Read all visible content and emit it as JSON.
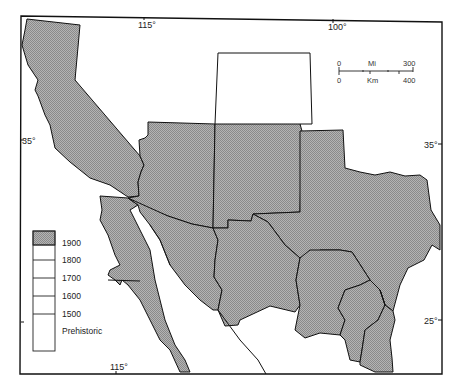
{
  "map": {
    "title": "",
    "fill_color": "#a8a8a8",
    "outline_color": "#111111",
    "graticule": {
      "top": [
        "115°",
        "100°"
      ],
      "bottom": [
        "115°"
      ],
      "left": [
        "35°"
      ],
      "right": [
        "35°",
        "25°"
      ]
    },
    "scale_bar": {
      "miles_start": "0",
      "miles_label": "Mi",
      "miles_end": "300",
      "km_start": "0",
      "km_label": "Km",
      "km_end": "400"
    },
    "legend": {
      "items": [
        {
          "label": "1900",
          "shaded": true
        },
        {
          "label": "1800",
          "shaded": false
        },
        {
          "label": "1700",
          "shaded": false
        },
        {
          "label": "1600",
          "shaded": false
        },
        {
          "label": "1500",
          "shaded": false
        },
        {
          "label": "Prehistoric",
          "shaded": false
        }
      ]
    },
    "regions": [
      {
        "name": "California",
        "shaded": true
      },
      {
        "name": "Arizona",
        "shaded": true
      },
      {
        "name": "New Mexico",
        "shaded": true
      },
      {
        "name": "Colorado",
        "shaded": false
      },
      {
        "name": "Texas",
        "shaded": true
      },
      {
        "name": "Baja California",
        "shaded": true
      },
      {
        "name": "Sonora",
        "shaded": true
      },
      {
        "name": "Chihuahua",
        "shaded": true
      },
      {
        "name": "Coahuila",
        "shaded": true
      },
      {
        "name": "Nuevo León",
        "shaded": true
      },
      {
        "name": "Tamaulipas",
        "shaded": true
      }
    ]
  }
}
